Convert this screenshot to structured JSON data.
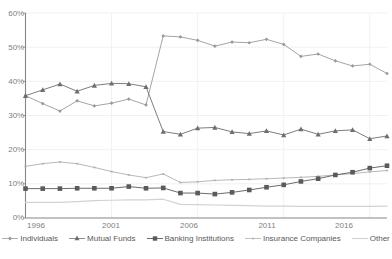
{
  "chart_data": {
    "type": "line",
    "title": "",
    "subtitle": "",
    "xlabel": "",
    "ylabel": "",
    "x": [
      1996,
      1997,
      1998,
      1999,
      2000,
      2001,
      2002,
      2003,
      2004,
      2005,
      2006,
      2007,
      2008,
      2009,
      2010,
      2011,
      2012,
      2013,
      2014,
      2015,
      2016,
      2017
    ],
    "xlim": [
      1996,
      2017
    ],
    "ylim": [
      0,
      60
    ],
    "ytick_labels": [
      "0%",
      "10%",
      "20%",
      "30%",
      "40%",
      "50%",
      "60%"
    ],
    "ytick_values": [
      0,
      10,
      20,
      30,
      40,
      50,
      60
    ],
    "xtick_labels": [
      "1996",
      "2001",
      "2006",
      "2011",
      "2016"
    ],
    "xtick_values": [
      1996,
      2001,
      2006,
      2011,
      2016
    ],
    "grid": "both-light",
    "legend_position": "bottom",
    "series": [
      {
        "name": "Individuals",
        "marker": "small-diamond",
        "color": "#9a9a9a",
        "values": [
          35.8,
          33.5,
          31.3,
          34.3,
          32.8,
          33.6,
          34.8,
          33.1,
          53.3,
          53.0,
          52.0,
          50.3,
          51.5,
          51.3,
          52.3,
          50.8,
          47.3,
          48.0,
          46.0,
          44.5,
          45.0,
          42.3
        ]
      },
      {
        "name": "Mutual Funds",
        "marker": "triangle",
        "color": "#6e6e6e",
        "values": [
          35.8,
          37.5,
          39.2,
          37.1,
          38.8,
          39.4,
          39.3,
          38.4,
          25.3,
          24.5,
          26.3,
          26.5,
          25.2,
          24.7,
          25.5,
          24.3,
          26.0,
          24.5,
          25.5,
          25.8,
          23.2,
          24.0
        ]
      },
      {
        "name": "Banking Institutions",
        "marker": "square",
        "color": "#5a5a5a",
        "values": [
          8.6,
          8.6,
          8.6,
          8.7,
          8.7,
          8.7,
          9.2,
          8.7,
          8.8,
          7.3,
          7.3,
          7.0,
          7.5,
          8.2,
          9.0,
          9.7,
          10.7,
          11.5,
          12.6,
          13.4,
          14.6,
          15.3
        ]
      },
      {
        "name": "Insurance Companies",
        "marker": "tiny-dash",
        "color": "#b0b0b0",
        "values": [
          15.1,
          15.9,
          16.4,
          15.9,
          14.8,
          13.6,
          12.6,
          11.8,
          12.9,
          10.4,
          10.6,
          11.0,
          11.2,
          11.3,
          11.5,
          11.7,
          11.9,
          12.2,
          12.6,
          13.0,
          13.5,
          13.9
        ]
      },
      {
        "name": "Other",
        "marker": "none",
        "color": "#d2d2d2",
        "values": [
          4.6,
          4.6,
          4.6,
          4.8,
          5.1,
          5.2,
          5.3,
          5.3,
          5.5,
          4.0,
          3.9,
          3.8,
          3.7,
          3.6,
          3.5,
          3.5,
          3.4,
          3.4,
          3.4,
          3.4,
          3.4,
          3.5
        ]
      }
    ]
  },
  "axis": {
    "y_labels": [
      "60%",
      "50%",
      "40%",
      "30%",
      "20%",
      "10%",
      "0%"
    ],
    "x_labels": [
      "1996",
      "2001",
      "2006",
      "2011",
      "2016"
    ]
  },
  "legend": {
    "items": [
      {
        "label": "Individuals"
      },
      {
        "label": "Mutual Funds"
      },
      {
        "label": "Banking Institutions"
      },
      {
        "label": "Insurance Companies"
      },
      {
        "label": "Other"
      }
    ]
  },
  "footer": {
    "cut_text": ""
  }
}
